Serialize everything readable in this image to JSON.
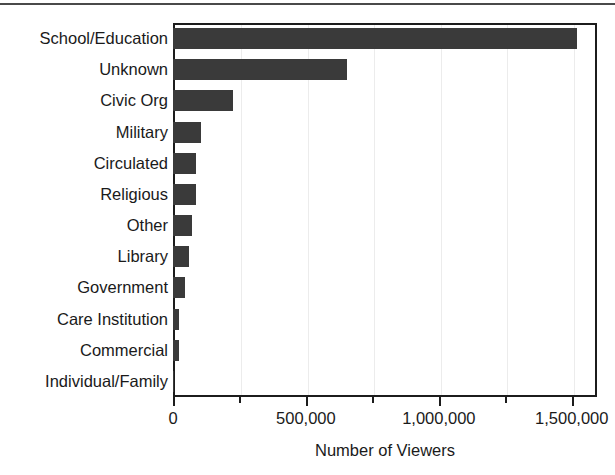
{
  "chart_data": {
    "type": "bar",
    "orientation": "horizontal",
    "title": "",
    "xlabel": "Number of Viewers",
    "ylabel": "",
    "categories": [
      "School/Education",
      "Unknown",
      "Civic Org",
      "Military",
      "Circulated",
      "Religious",
      "Other",
      "Library",
      "Government",
      "Care Institution",
      "Commercial",
      "Individual/Family"
    ],
    "values": [
      1520000,
      655000,
      225000,
      105000,
      86000,
      85000,
      72000,
      62000,
      45000,
      23000,
      23000,
      2000
    ],
    "xlim": [
      0,
      1595000
    ],
    "xtick_labels": [
      "0",
      "500,000",
      "1,000,000",
      "1,500,000"
    ],
    "xtick_values": [
      0,
      500000,
      1000000,
      1500000
    ],
    "xtick_minor_values": [
      250000,
      750000,
      1250000
    ],
    "grid": true,
    "grid_axis": "x",
    "legend": "none",
    "bar_color": "#3a3a3a",
    "frame_color": "#1c1c1c",
    "gridline_color": "#ececec"
  },
  "figure": {
    "top_rule_color": "#4a4a4a"
  }
}
